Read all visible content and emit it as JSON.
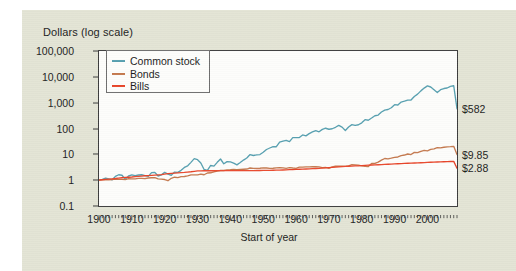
{
  "figure": {
    "background_color": "#e3e4d5",
    "plot_background_color": "#fdfdfb",
    "axis_color": "#3b3b3b"
  },
  "yaxis": {
    "title": "Dollars (log scale)",
    "ticks": [
      "100,000",
      "10,000",
      "1,000",
      "100",
      "10",
      "1",
      "0.1"
    ],
    "tick_values": [
      100000,
      10000,
      1000,
      100,
      10,
      1,
      0.1
    ]
  },
  "xaxis": {
    "title": "Start of year",
    "ticks": [
      "1900",
      "1910",
      "1920",
      "1930",
      "1940",
      "1950",
      "1960",
      "1970",
      "1980",
      "1990",
      "2000"
    ],
    "tick_values": [
      1900,
      1910,
      1920,
      1930,
      1940,
      1950,
      1960,
      1970,
      1980,
      1990,
      2000
    ]
  },
  "legend": {
    "position": "top-left-inside",
    "items": [
      {
        "label": "Common stock",
        "color": "#57a0b0"
      },
      {
        "label": "Bonds",
        "color": "#c4794e"
      },
      {
        "label": "Bills",
        "color": "#e8462a"
      }
    ]
  },
  "end_labels": [
    {
      "text": "$582",
      "series": "Common stock",
      "value": 582
    },
    {
      "text": "$9.85",
      "series": "Bonds",
      "value": 9.85
    },
    {
      "text": "$2.88",
      "series": "Bills",
      "value": 2.88
    }
  ],
  "chart_data": {
    "type": "line",
    "title": "",
    "xlabel": "Start of year",
    "ylabel": "Dollars (log scale)",
    "yscale": "log",
    "ylim": [
      0.1,
      100000
    ],
    "xlim": [
      1900,
      2009
    ],
    "grid": false,
    "legend_position": "upper left",
    "x": [
      1900,
      1901,
      1902,
      1903,
      1904,
      1905,
      1906,
      1907,
      1908,
      1909,
      1910,
      1911,
      1912,
      1913,
      1914,
      1915,
      1916,
      1917,
      1918,
      1919,
      1920,
      1921,
      1922,
      1923,
      1924,
      1925,
      1926,
      1927,
      1928,
      1929,
      1930,
      1931,
      1932,
      1933,
      1934,
      1935,
      1936,
      1937,
      1938,
      1939,
      1940,
      1941,
      1942,
      1943,
      1944,
      1945,
      1946,
      1947,
      1948,
      1949,
      1950,
      1951,
      1952,
      1953,
      1954,
      1955,
      1956,
      1957,
      1958,
      1959,
      1960,
      1961,
      1962,
      1963,
      1964,
      1965,
      1966,
      1967,
      1968,
      1969,
      1970,
      1971,
      1972,
      1973,
      1974,
      1975,
      1976,
      1977,
      1978,
      1979,
      1980,
      1981,
      1982,
      1983,
      1984,
      1985,
      1986,
      1987,
      1988,
      1989,
      1990,
      1991,
      1992,
      1993,
      1994,
      1995,
      1996,
      1997,
      1998,
      1999,
      2000,
      2001,
      2002,
      2003,
      2004,
      2005,
      2006,
      2007,
      2008,
      2009
    ],
    "series": [
      {
        "name": "Common stock",
        "color": "#57a0b0",
        "final_value": 582,
        "values": [
          1,
          1.08,
          1.2,
          1.12,
          1.04,
          1.4,
          1.62,
          1.55,
          1.08,
          1.45,
          1.6,
          1.5,
          1.58,
          1.62,
          1.5,
          1.4,
          1.95,
          2.0,
          1.45,
          1.6,
          2.0,
          1.7,
          1.55,
          2.05,
          2.0,
          2.4,
          3.1,
          3.6,
          4.9,
          6.8,
          6.2,
          4.6,
          2.6,
          2.4,
          3.7,
          3.5,
          4.9,
          6.6,
          4.3,
          5.2,
          5.1,
          4.6,
          3.9,
          4.8,
          6.0,
          7.2,
          9.8,
          9.0,
          9.5,
          9.8,
          12.0,
          15.4,
          17.6,
          20.0,
          19.7,
          29.6,
          32.5,
          34.6,
          30.9,
          44.3,
          44.5,
          44.6,
          56.5,
          51.6,
          63.1,
          73.5,
          82.6,
          74.4,
          92.2,
          102.4,
          93.7,
          97.7,
          111.6,
          132.7,
          113.3,
          83.2,
          114.2,
          141.5,
          131.4,
          140.0,
          166.2,
          220.0,
          209.1,
          254.0,
          311.2,
          330.9,
          436.0,
          517.5,
          544.5,
          635.0,
          836.0,
          810.0,
          1057.0,
          1138.0,
          1252.0,
          1268.0,
          1744.0,
          2144.0,
          2860.0,
          3676.0,
          4450.0,
          4045.0,
          3170.0,
          2470.0,
          3178.0,
          3525.0,
          3693.0,
          4275.0,
          4513.0,
          582.0
        ]
      },
      {
        "name": "Bonds",
        "color": "#c4794e",
        "final_value": 9.85,
        "values": [
          1,
          1.02,
          1.04,
          1.03,
          1.05,
          1.09,
          1.08,
          1.07,
          1.05,
          1.14,
          1.13,
          1.13,
          1.17,
          1.18,
          1.14,
          1.21,
          1.24,
          1.25,
          1.12,
          1.1,
          1.06,
          0.95,
          1.18,
          1.3,
          1.26,
          1.38,
          1.39,
          1.47,
          1.6,
          1.6,
          1.6,
          1.72,
          1.62,
          1.9,
          1.93,
          2.1,
          2.24,
          2.37,
          2.36,
          2.5,
          2.53,
          2.6,
          2.55,
          2.59,
          2.64,
          2.7,
          2.96,
          2.88,
          2.85,
          2.9,
          3.0,
          2.95,
          2.87,
          2.9,
          2.97,
          3.04,
          3.0,
          2.88,
          3.05,
          2.95,
          2.88,
          3.2,
          3.2,
          3.28,
          3.29,
          3.35,
          3.3,
          3.25,
          3.08,
          3.1,
          2.85,
          3.25,
          3.45,
          3.5,
          3.45,
          3.4,
          3.6,
          4.0,
          3.9,
          3.8,
          3.6,
          3.4,
          3.35,
          4.4,
          4.45,
          5.0,
          6.0,
          6.9,
          6.7,
          7.1,
          7.6,
          7.9,
          8.9,
          9.4,
          10.3,
          9.8,
          11.9,
          11.6,
          12.9,
          14.2,
          13.6,
          15.5,
          16.2,
          18.2,
          17.8,
          18.8,
          19.5,
          19.8,
          20.4,
          9.85
        ]
      },
      {
        "name": "Bills",
        "color": "#e8462a",
        "final_value": 2.88,
        "values": [
          1,
          1.04,
          1.07,
          1.1,
          1.13,
          1.16,
          1.2,
          1.24,
          1.28,
          1.3,
          1.33,
          1.37,
          1.4,
          1.44,
          1.48,
          1.5,
          1.53,
          1.56,
          1.6,
          1.65,
          1.72,
          1.79,
          1.84,
          1.88,
          1.92,
          1.96,
          2.0,
          2.06,
          2.12,
          2.2,
          2.28,
          2.3,
          2.31,
          2.31,
          2.32,
          2.32,
          2.33,
          2.33,
          2.33,
          2.33,
          2.33,
          2.33,
          2.33,
          2.34,
          2.34,
          2.34,
          2.35,
          2.35,
          2.36,
          2.37,
          2.38,
          2.39,
          2.41,
          2.43,
          2.45,
          2.46,
          2.48,
          2.51,
          2.55,
          2.57,
          2.6,
          2.64,
          2.67,
          2.7,
          2.74,
          2.78,
          2.83,
          2.88,
          2.93,
          2.99,
          3.06,
          3.14,
          3.2,
          3.26,
          3.34,
          3.4,
          3.45,
          3.5,
          3.55,
          3.6,
          3.66,
          3.72,
          3.8,
          3.85,
          3.9,
          3.96,
          4.02,
          4.08,
          4.14,
          4.2,
          4.26,
          4.32,
          4.38,
          4.44,
          4.5,
          4.56,
          4.62,
          4.68,
          4.74,
          4.8,
          4.86,
          4.92,
          4.98,
          5.04,
          5.1,
          5.16,
          5.22,
          5.28,
          5.34,
          2.88
        ]
      }
    ]
  }
}
